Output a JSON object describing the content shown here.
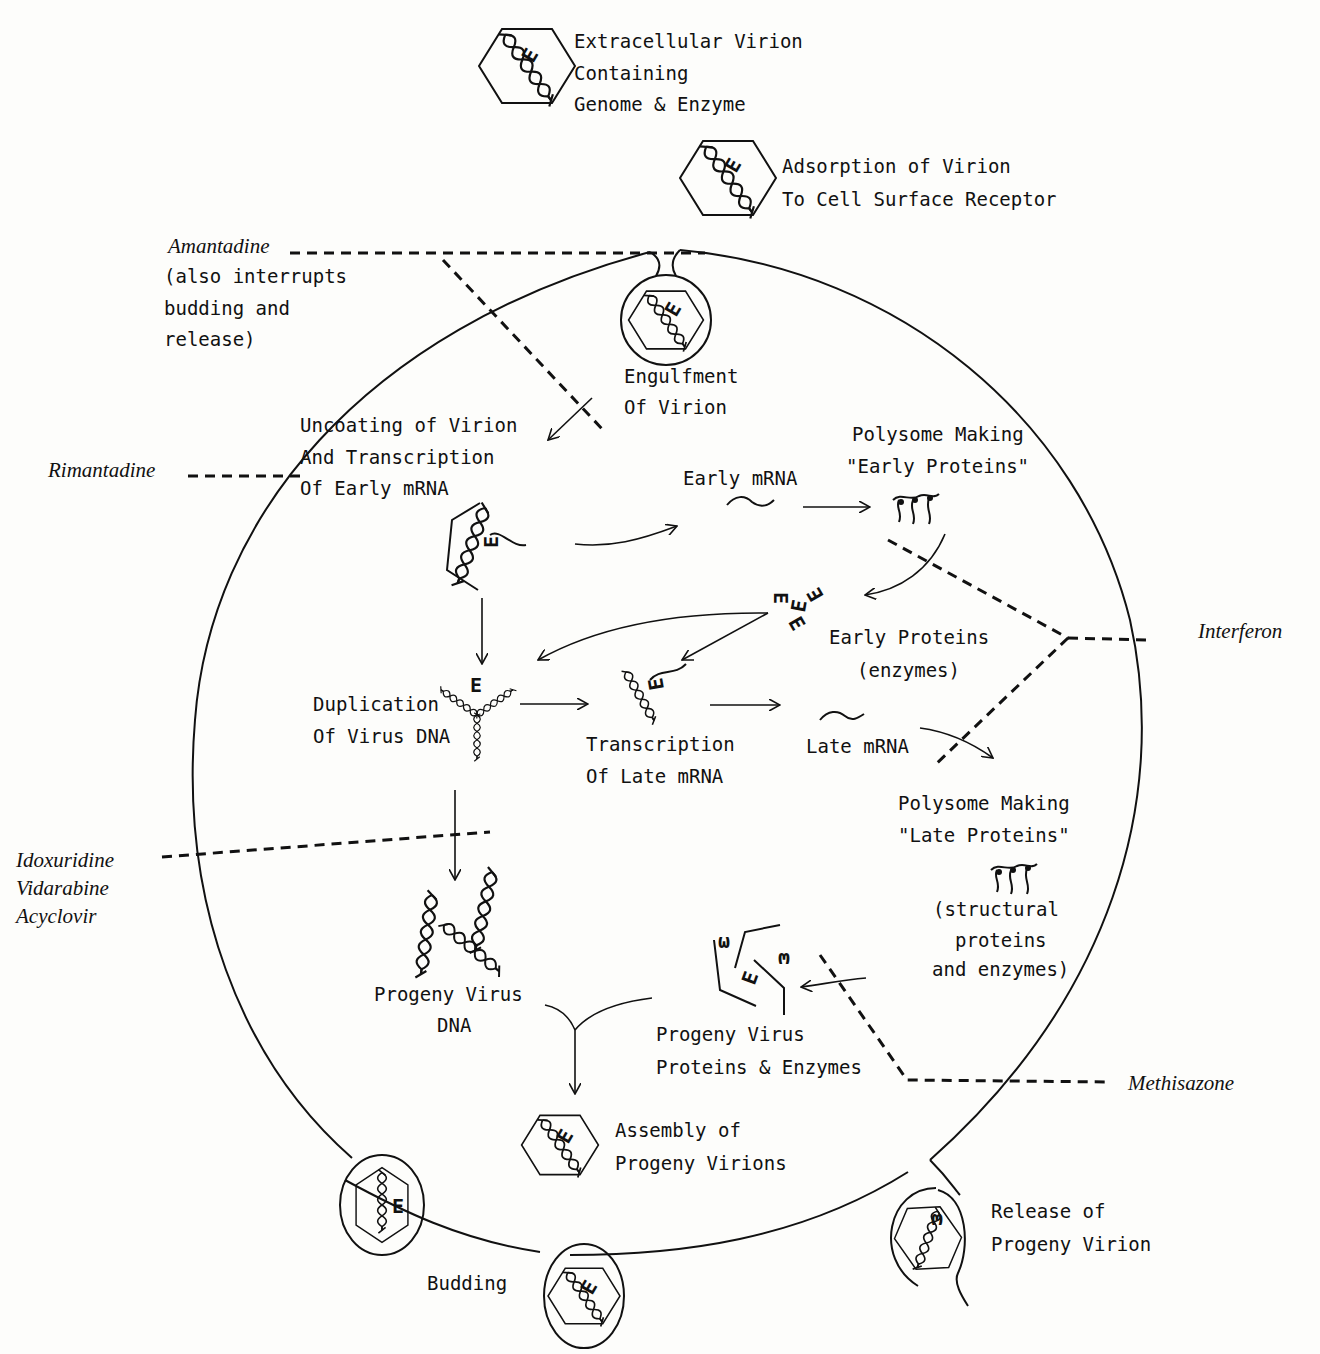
{
  "stages": {
    "extracellular": [
      "Extracellular Virion",
      "Containing",
      "Genome & Enzyme"
    ],
    "adsorption": [
      "Adsorption of Virion",
      "To Cell Surface Receptor"
    ],
    "engulfment": [
      "Engulfment",
      "Of Virion"
    ],
    "uncoating": [
      "Uncoating of Virion",
      "And Transcription",
      "Of Early mRNA"
    ],
    "early_mrna": "Early mRNA",
    "polysome_early": [
      "Polysome Making",
      "\"Early Proteins\""
    ],
    "early_proteins": [
      "Early Proteins",
      "(enzymes)"
    ],
    "duplication": [
      "Duplication",
      "Of Virus DNA"
    ],
    "transcription_late": [
      "Transcription",
      "Of Late mRNA"
    ],
    "late_mrna": "Late mRNA",
    "polysome_late": [
      "Polysome Making",
      "\"Late Proteins\""
    ],
    "late_proteins_note": [
      "(structural",
      "proteins",
      "and enzymes)"
    ],
    "progeny_dna": [
      "Progeny Virus",
      "DNA"
    ],
    "progeny_proteins": [
      "Progeny Virus",
      "Proteins & Enzymes"
    ],
    "assembly": [
      "Assembly of",
      "Progeny Virions"
    ],
    "budding": "Budding",
    "release": [
      "Release of",
      "Progeny Virion"
    ]
  },
  "drugs": {
    "amantadine": "Amantadine",
    "amantadine_note": [
      "(also interrupts",
      "budding and",
      "release)"
    ],
    "rimantadine": "Rimantadine",
    "interferon": "Interferon",
    "dna_inhibitors": [
      "Idoxuridine",
      "Vidarabine",
      "Acyclovir"
    ],
    "methisazone": "Methisazone"
  },
  "glyphs": {
    "enzyme_symbol": "E",
    "enzyme_rotated": "ω"
  },
  "colors": {
    "ink": "#111111",
    "paper": "#fdfdfb"
  }
}
